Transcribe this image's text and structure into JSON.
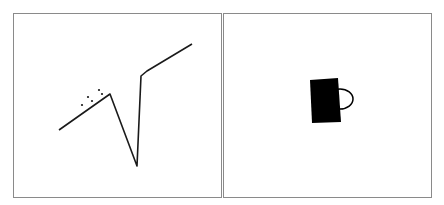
{
  "panels": [
    {
      "id": "left",
      "description": "line sketch with dots",
      "stroke_color": "#1a1a1a",
      "line_points": [
        [
          45,
          116
        ],
        [
          96,
          80
        ],
        [
          123,
          152
        ],
        [
          127,
          62
        ],
        [
          133,
          57
        ],
        [
          178,
          30
        ]
      ],
      "dots": [
        [
          68,
          91
        ],
        [
          74,
          83
        ],
        [
          78,
          87
        ],
        [
          85,
          76
        ],
        [
          88,
          80
        ]
      ]
    },
    {
      "id": "right",
      "description": "mug silhouette",
      "fill_color": "#000000",
      "body": [
        [
          86,
          66
        ],
        [
          114,
          64
        ],
        [
          117,
          108
        ],
        [
          88,
          109
        ]
      ],
      "handle": {
        "cx": 116,
        "cy": 85,
        "rx": 13,
        "ry": 10
      }
    }
  ],
  "colors": {
    "background": "#ffffff",
    "border": "#8a8a8a",
    "ink": "#111111"
  }
}
